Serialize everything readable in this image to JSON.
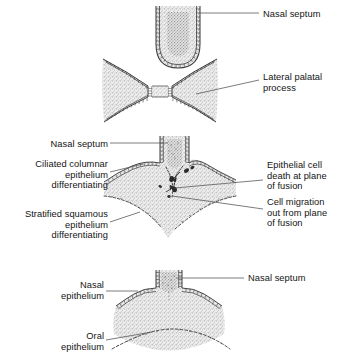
{
  "figure": {
    "panels": [
      {
        "id": "panel-1",
        "stage": "Pre-fusion: lateral palatal processes approaching midline",
        "labels": [
          {
            "id": "nasal-septum-1",
            "text": "Nasal septum",
            "align": "left",
            "x": 263,
            "y": 9
          },
          {
            "id": "lateral-palatal-process",
            "text": "Lateral palatal\nprocess",
            "align": "left",
            "x": 263,
            "y": 72
          }
        ]
      },
      {
        "id": "panel-2",
        "stage": "Fusion: epithelial seam breaking down",
        "labels": [
          {
            "id": "nasal-septum-2",
            "text": "Nasal septum",
            "align": "right",
            "x": 18,
            "y": 139
          },
          {
            "id": "ciliated-columnar",
            "text": "Ciliated columnar\nepithelium\ndifferentiating",
            "align": "right",
            "x": 6,
            "y": 159
          },
          {
            "id": "stratified-squamous",
            "text": "Stratified squamous\nepithelium\ndifferentiating",
            "align": "right",
            "x": 2,
            "y": 209
          },
          {
            "id": "epithelial-cell-death",
            "text": "Epithelial cell\ndeath at plane\nof fusion",
            "align": "left",
            "x": 267,
            "y": 160
          },
          {
            "id": "cell-migration",
            "text": "Cell migration\nout from plane\nof fusion",
            "align": "left",
            "x": 267,
            "y": 197
          }
        ]
      },
      {
        "id": "panel-3",
        "stage": "Post-fusion: continuous secondary palate",
        "labels": [
          {
            "id": "nasal-epithelium",
            "text": "Nasal\nepithelium",
            "align": "right",
            "x": 32,
            "y": 280
          },
          {
            "id": "oral-epithelium",
            "text": "Oral\nepithelium",
            "align": "right",
            "x": 32,
            "y": 331
          },
          {
            "id": "nasal-septum-3",
            "text": "Nasal septum",
            "align": "left",
            "x": 248,
            "y": 273
          }
        ]
      }
    ],
    "colors": {
      "mesenchyme_stipple": "#b9b9b9",
      "mesenchyme_fill": "#dedede",
      "outline": "#3a3a3a",
      "leader_line": "#5a5a5a",
      "text": "#141414",
      "background": "#ffffff"
    }
  }
}
